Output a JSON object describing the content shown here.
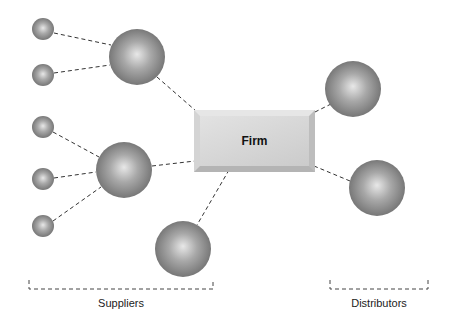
{
  "diagram": {
    "center_node": {
      "label": "Firm"
    },
    "groups": [
      {
        "id": "suppliers",
        "label": "Suppliers",
        "bracket": {
          "x1": 29,
          "x2": 213
        }
      },
      {
        "id": "distributors",
        "label": "Distributors",
        "bracket": {
          "x1": 330,
          "x2": 428
        }
      }
    ],
    "colors": {
      "background": "#ffffff",
      "sphere_light": "#e8e8e8",
      "sphere_mid": "#a8a8a8",
      "sphere_dark": "#6e6e6e",
      "line": "#333333",
      "firm_box": "#d6d6d6"
    },
    "nodes": [
      {
        "id": "s-small-1",
        "group": "suppliers",
        "size": "small",
        "cx": 43,
        "cy": 29,
        "r": 11
      },
      {
        "id": "s-small-2",
        "group": "suppliers",
        "size": "small",
        "cx": 43,
        "cy": 75,
        "r": 11
      },
      {
        "id": "s-large-1",
        "group": "suppliers",
        "size": "large",
        "cx": 137,
        "cy": 57,
        "r": 28
      },
      {
        "id": "s-small-3",
        "group": "suppliers",
        "size": "small",
        "cx": 43,
        "cy": 127,
        "r": 11
      },
      {
        "id": "s-small-4",
        "group": "suppliers",
        "size": "small",
        "cx": 43,
        "cy": 179,
        "r": 11
      },
      {
        "id": "s-small-5",
        "group": "suppliers",
        "size": "small",
        "cx": 43,
        "cy": 226,
        "r": 11
      },
      {
        "id": "s-large-2",
        "group": "suppliers",
        "size": "large",
        "cx": 124,
        "cy": 170,
        "r": 28
      },
      {
        "id": "s-large-3",
        "group": "suppliers",
        "size": "large",
        "cx": 183,
        "cy": 249,
        "r": 28
      },
      {
        "id": "d-large-1",
        "group": "distributors",
        "size": "large",
        "cx": 353,
        "cy": 89,
        "r": 28
      },
      {
        "id": "d-large-2",
        "group": "distributors",
        "size": "large",
        "cx": 377,
        "cy": 188,
        "r": 28
      }
    ],
    "edges": [
      {
        "from": "s-small-1",
        "to": "s-large-1",
        "x1": 54,
        "y1": 33,
        "x2": 111,
        "y2": 45
      },
      {
        "from": "s-small-2",
        "to": "s-large-1",
        "x1": 54,
        "y1": 73,
        "x2": 110,
        "y2": 65
      },
      {
        "from": "s-large-1",
        "to": "firm",
        "x1": 157,
        "y1": 77,
        "x2": 196,
        "y2": 111
      },
      {
        "from": "s-small-3",
        "to": "s-large-2",
        "x1": 53,
        "y1": 132,
        "x2": 99,
        "y2": 157
      },
      {
        "from": "s-small-4",
        "to": "s-large-2",
        "x1": 54,
        "y1": 178,
        "x2": 96,
        "y2": 172
      },
      {
        "from": "s-small-5",
        "to": "s-large-2",
        "x1": 53,
        "y1": 221,
        "x2": 101,
        "y2": 187
      },
      {
        "from": "s-large-2",
        "to": "firm",
        "x1": 152,
        "y1": 166,
        "x2": 195,
        "y2": 161
      },
      {
        "from": "firm",
        "to": "s-large-3",
        "x1": 229,
        "y1": 170,
        "x2": 197,
        "y2": 225
      },
      {
        "from": "firm",
        "to": "d-large-1",
        "x1": 315,
        "y1": 112,
        "x2": 331,
        "y2": 104
      },
      {
        "from": "firm",
        "to": "d-large-2",
        "x1": 314,
        "y1": 166,
        "x2": 350,
        "y2": 181
      }
    ]
  }
}
